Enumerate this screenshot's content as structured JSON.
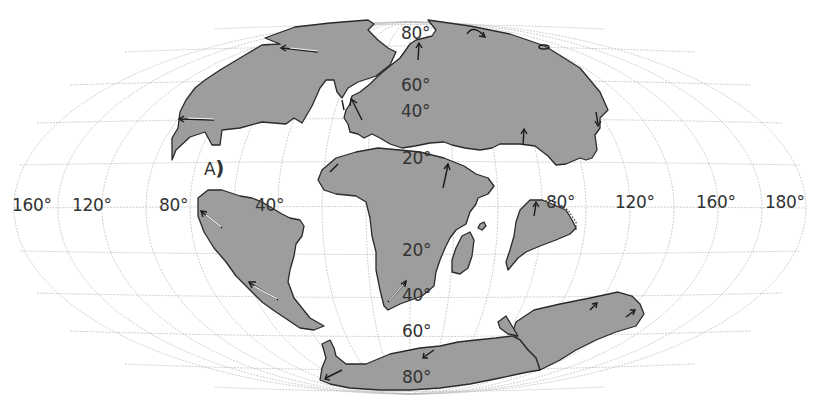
{
  "map": {
    "projection": "Mollweide (elliptical world grid)",
    "colors": {
      "land": "#9d9d9d",
      "coastline": "#2a2a2a",
      "grid": "#b8b8b8",
      "ocean": "#ffffff",
      "arrows": "#1a1a1a"
    },
    "longitude_labels": [
      {
        "text": "160°",
        "x": 12,
        "y": 197
      },
      {
        "text": "120°",
        "x": 72,
        "y": 197
      },
      {
        "text": "80°",
        "x": 159,
        "y": 197
      },
      {
        "text": "40°",
        "x": 255,
        "y": 197
      },
      {
        "text": "80°",
        "x": 546,
        "y": 194
      },
      {
        "text": "120°",
        "x": 615,
        "y": 194
      },
      {
        "text": "160°",
        "x": 696,
        "y": 194
      },
      {
        "text": "180°",
        "x": 765,
        "y": 194
      }
    ],
    "latitude_labels": [
      {
        "text": "80°",
        "x": 401,
        "y": 25
      },
      {
        "text": "60°",
        "x": 401,
        "y": 77
      },
      {
        "text": "40°",
        "x": 401,
        "y": 103
      },
      {
        "text": "20°",
        "x": 402,
        "y": 150
      },
      {
        "text": "20°",
        "x": 402,
        "y": 242
      },
      {
        "text": "40°",
        "x": 402,
        "y": 287
      },
      {
        "text": "60°",
        "x": 402,
        "y": 323
      },
      {
        "text": "80°",
        "x": 402,
        "y": 369
      }
    ],
    "annotation": {
      "text": "A",
      "paren": ")",
      "x": 204,
      "y": 158
    },
    "landmasses": [
      "north-america",
      "eurasia",
      "africa",
      "south-america",
      "madagascar",
      "india",
      "australia",
      "antarctica",
      "small-island-south-atlantic"
    ]
  }
}
